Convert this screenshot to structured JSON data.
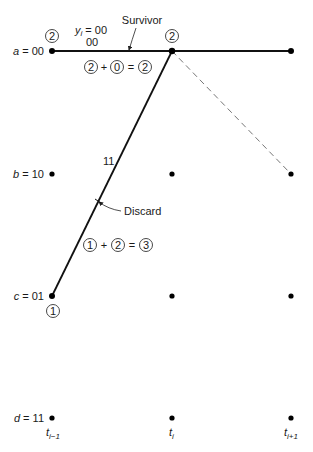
{
  "diagram": {
    "states": [
      {
        "var": "a",
        "value": "00"
      },
      {
        "var": "b",
        "value": "10"
      },
      {
        "var": "c",
        "value": "01"
      },
      {
        "var": "d",
        "value": "11"
      }
    ],
    "time_labels": [
      {
        "base": "t",
        "sub": "i−1"
      },
      {
        "base": "t",
        "sub": "i"
      },
      {
        "base": "t",
        "sub": "i+1"
      }
    ],
    "received": {
      "var": "y",
      "sub": "i",
      "value": "= 00"
    },
    "branch_labels": {
      "a_to_a": "00",
      "c_to_a": "11"
    },
    "path_metrics": {
      "a_prev": "2",
      "c_prev": "1",
      "a_current": "2"
    },
    "survivor_sum": {
      "a": "2",
      "b": "0",
      "result": "2",
      "plus": "+",
      "equals": "="
    },
    "discard_sum": {
      "a": "1",
      "b": "2",
      "result": "3",
      "plus": "+",
      "equals": "="
    },
    "annotations": {
      "survivor": "Survivor",
      "discard": "Discard"
    }
  }
}
